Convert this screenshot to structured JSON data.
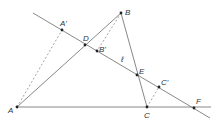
{
  "diagram": {
    "type": "geometry",
    "colors": {
      "line": "#7a7a7a",
      "dashed": "#9a9a9a",
      "point": "#222222",
      "label": "#333333"
    },
    "points": [
      {
        "name": "A",
        "label": "A",
        "x": 17,
        "y": 107,
        "lx": 8,
        "ly": 113
      },
      {
        "name": "B",
        "label": "B",
        "x": 121,
        "y": 13,
        "lx": 125,
        "ly": 15
      },
      {
        "name": "C",
        "label": "C",
        "x": 147,
        "y": 107,
        "lx": 144,
        "ly": 118
      },
      {
        "name": "D",
        "label": "D",
        "x": 85,
        "y": 45,
        "lx": 83,
        "ly": 41
      },
      {
        "name": "E",
        "label": "E",
        "x": 137,
        "y": 75,
        "lx": 139,
        "ly": 74
      },
      {
        "name": "F",
        "label": "F",
        "x": 194,
        "y": 108,
        "lx": 196,
        "ly": 104
      },
      {
        "name": "A-prime",
        "label": "A'",
        "x": 62,
        "y": 30,
        "lx": 60,
        "ly": 26
      },
      {
        "name": "B-prime",
        "label": "B'",
        "x": 97,
        "y": 51,
        "lx": 99,
        "ly": 52
      },
      {
        "name": "C-prime",
        "label": "C'",
        "x": 159,
        "y": 87,
        "lx": 161,
        "ly": 85
      }
    ],
    "line_label": {
      "label": "ℓ",
      "x": 121,
      "y": 62
    },
    "lines": [
      {
        "name": "line-l",
        "x1": 33,
        "y1": 13,
        "x2": 210,
        "y2": 118,
        "dashed": false
      },
      {
        "name": "side-ab",
        "x1": 17,
        "y1": 107,
        "x2": 121,
        "y2": 13,
        "dashed": false
      },
      {
        "name": "side-bc",
        "x1": 121,
        "y1": 13,
        "x2": 147,
        "y2": 107,
        "dashed": false
      },
      {
        "name": "side-ac-extended",
        "x1": 17,
        "y1": 107,
        "x2": 211,
        "y2": 107,
        "dashed": false
      },
      {
        "name": "dash-aa-prime",
        "x1": 17,
        "y1": 107,
        "x2": 62,
        "y2": 30,
        "dashed": true
      },
      {
        "name": "dash-bb-prime",
        "x1": 121,
        "y1": 13,
        "x2": 97,
        "y2": 51,
        "dashed": true
      },
      {
        "name": "dash-cc-prime",
        "x1": 147,
        "y1": 107,
        "x2": 159,
        "y2": 87,
        "dashed": true
      }
    ]
  }
}
